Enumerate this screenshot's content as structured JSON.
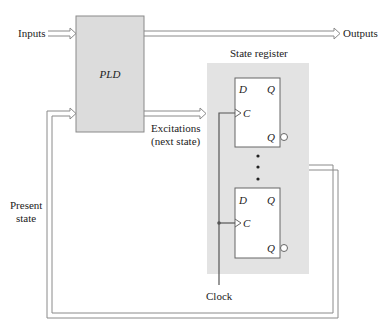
{
  "diagram": {
    "colors": {
      "background": "#ffffff",
      "block_fill": "#dcdcdc",
      "register_fill": "#e3e3e3",
      "flipflop_fill": "#ffffff",
      "line": "#8a8a8a",
      "dark_line": "#555555",
      "text": "#222222"
    },
    "pld": {
      "label": "PLD"
    },
    "signals": {
      "inputs": "Inputs",
      "outputs": "Outputs",
      "excitations_line1": "Excitations",
      "excitations_line2": "(next state)",
      "present_state_line1": "Present",
      "present_state_line2": "state",
      "clock": "Clock"
    },
    "state_register": {
      "label": "State register",
      "flipflops": [
        {
          "d": "D",
          "q": "Q",
          "c": "C",
          "qbar": "Q"
        },
        {
          "d": "D",
          "q": "Q",
          "c": "C",
          "qbar": "Q"
        }
      ],
      "ellipsis": "⋮"
    }
  }
}
